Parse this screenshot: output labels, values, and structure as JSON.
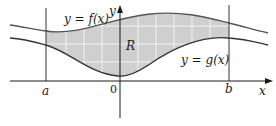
{
  "diagram": {
    "labels": {
      "f_curve": "y = f(x)",
      "g_curve": "y = g(x)",
      "region": "R",
      "x_axis": "x",
      "y_axis": "y",
      "a": "a",
      "b": "b",
      "origin": "0"
    },
    "colors": {
      "region_fill": "#cfcfcf",
      "grid": "#ffffff",
      "curve": "#555555",
      "axis": "#1a1a1a",
      "background": "#ffffff"
    }
  }
}
